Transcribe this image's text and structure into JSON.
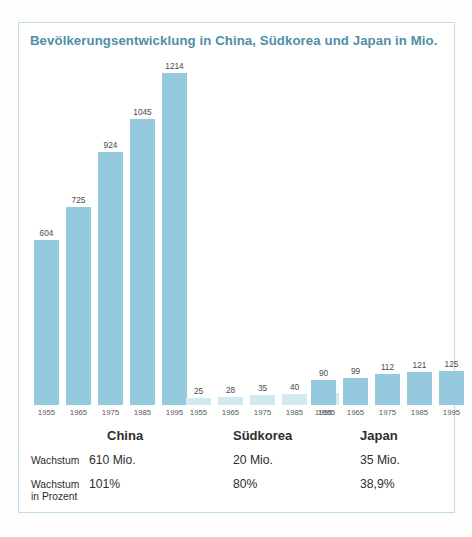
{
  "chart_data": {
    "type": "bar",
    "title": "Bevölkerungsentwicklung in China, Südkorea und Japan in Mio.",
    "xlabel": "",
    "ylabel": "",
    "ylim": [
      0,
      1214
    ],
    "grid": false,
    "legend_position": "none",
    "categories": [
      "1955",
      "1965",
      "1975",
      "1985",
      "1995"
    ],
    "series": [
      {
        "name": "China",
        "values": [
          604,
          725,
          924,
          1045,
          1214
        ],
        "color": "#95cade"
      },
      {
        "name": "Südkorea",
        "values": [
          25,
          28,
          35,
          40,
          45
        ],
        "color": "#d3e9f2"
      },
      {
        "name": "Japan",
        "values": [
          90,
          99,
          112,
          121,
          125
        ],
        "color": "#95cade"
      }
    ],
    "annotations": {
      "growth_row_label": "Wachstum",
      "growth_percent_row_label": "Wachstum in Prozent",
      "growth_absolute": [
        "610 Mio.",
        "20 Mio.",
        "35 Mio."
      ],
      "growth_percent": [
        "101%",
        "80%",
        "38,9%"
      ]
    }
  },
  "table": {
    "rows": [
      {
        "label_line1": "Wachstum",
        "label_line2": "",
        "values": [
          "610 Mio.",
          "20 Mio.",
          "35 Mio."
        ]
      },
      {
        "label_line1": "Wachstum",
        "label_line2": "in Prozent",
        "values": [
          "101%",
          "80%",
          "38,9%"
        ]
      }
    ]
  },
  "groups": [
    {
      "name": "China"
    },
    {
      "name": "Südkorea"
    },
    {
      "name": "Japan"
    }
  ]
}
